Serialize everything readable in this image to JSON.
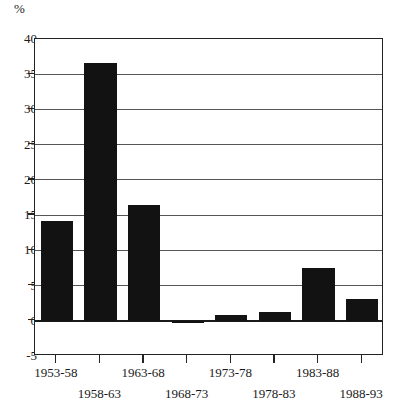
{
  "chart_data": {
    "type": "bar",
    "title": "",
    "subtitle": "",
    "xlabel": "",
    "ylabel": "%",
    "ylim": [
      -5,
      40
    ],
    "ytick_step": 5,
    "yticks": [
      40,
      35,
      30,
      25,
      20,
      15,
      10,
      5,
      0,
      -5
    ],
    "ytick_labels": [
      "40",
      "35",
      "30",
      "25",
      "20",
      "15",
      "10",
      "5",
      "0",
      "-5"
    ],
    "grid": "horizontal-gridlines-at-each-5-percent-above-zero",
    "legend": "none",
    "categories": [
      "1953-58",
      "1958-63",
      "1963-68",
      "1968-73",
      "1973-78",
      "1978-83",
      "1983-88",
      "1988-93"
    ],
    "values": [
      14.1,
      36.6,
      16.4,
      -0.2,
      0.8,
      1.3,
      7.5,
      3.1
    ],
    "bar_color": "#121212",
    "axis_color": "#222222",
    "gridline_color": "#555555",
    "zero_line_color": "#1a1a1a",
    "background_color": "#ffffff"
  },
  "axis": {
    "unit_label": "%"
  }
}
